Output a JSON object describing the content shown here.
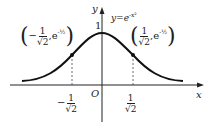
{
  "figure": {
    "curve_label": "y=e",
    "curve_exponent": "-x²",
    "y_axis_label": "y",
    "x_axis_label": "x",
    "origin_label": "O",
    "peak_label": "1",
    "left_point": {
      "sign": "−",
      "num": "1",
      "den": "√2",
      "exp": "e",
      "exp_power": "-½"
    },
    "right_point": {
      "num": "1",
      "den": "√2",
      "exp": "e",
      "exp_power": "-½"
    },
    "left_tick": {
      "sign": "−",
      "num": "1",
      "den": "√2"
    },
    "right_tick": {
      "num": "1",
      "den": "√2"
    }
  }
}
